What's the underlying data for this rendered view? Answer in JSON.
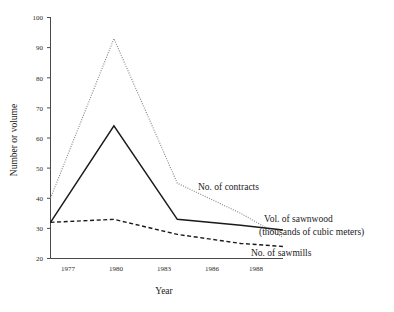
{
  "chart_data": {
    "type": "line",
    "title": "",
    "xlabel": "Year",
    "ylabel": "Number or volume",
    "categories": [
      "1977",
      "1980",
      "1983",
      "1986",
      "1988"
    ],
    "x": [
      1977,
      1980,
      1983,
      1986,
      1988
    ],
    "xlim": [
      1977,
      1988
    ],
    "ylim": [
      20,
      100
    ],
    "yticks": [
      20,
      30,
      40,
      50,
      60,
      70,
      80,
      90,
      100
    ],
    "ytick_labels": [
      "20",
      "30",
      "40",
      "50",
      "60",
      "70",
      "80",
      "90",
      "100"
    ],
    "xticks": [
      1977,
      1980,
      1983,
      1986,
      1988
    ],
    "xtick_labels": [
      "1977",
      "1980",
      "1983",
      "1986",
      "1988"
    ],
    "grid": false,
    "legend_position": "inline-annotations",
    "series": [
      {
        "name": "No. of contracts",
        "style": "dotted",
        "color": "#8c8c8c",
        "values": [
          40,
          93,
          45,
          35,
          27
        ]
      },
      {
        "name": "Vol. of sawnwood (thousands of cubic meters)",
        "style": "solid",
        "color": "#1a1a1a",
        "values": [
          32,
          64,
          33,
          31,
          29.5
        ]
      },
      {
        "name": "No. of sawmills",
        "style": "dashed",
        "color": "#1a1a1a",
        "values": [
          32,
          33,
          28,
          25,
          24
        ]
      }
    ],
    "annotations": [
      {
        "key": "contracts",
        "text": "No. of contracts",
        "x": 1983.6,
        "y": 46
      },
      {
        "key": "sawnwood_line1",
        "text": "Vol. of sawnwood",
        "x": 1988.3,
        "y": 34
      },
      {
        "key": "sawnwood_line2",
        "text": "(thousands of cubic meters)",
        "x": 1988.3,
        "y": 30.5
      },
      {
        "key": "sawmills",
        "text": "No. of sawmills",
        "x": 1987.1,
        "y": 23
      }
    ]
  },
  "axes": {
    "y_title": "Number or volume",
    "x_title": "Year",
    "ytick_labels": [
      "100",
      "90",
      "80",
      "70",
      "60",
      "50",
      "40",
      "30",
      "20"
    ],
    "xtick_labels": [
      "1977",
      "1980",
      "1983",
      "1986",
      "1988"
    ]
  },
  "annotations": {
    "contracts": "No. of contracts",
    "sawnwood_line1": "Vol. of sawnwood",
    "sawnwood_line2": "(thousands of cubic meters)",
    "sawmills": "No. of sawmills"
  },
  "colors": {
    "contracts": "#8c8c8c",
    "sawnwood": "#1a1a1a",
    "sawmills": "#1a1a1a",
    "axis": "#4a4a4a",
    "background": "#ffffff"
  }
}
